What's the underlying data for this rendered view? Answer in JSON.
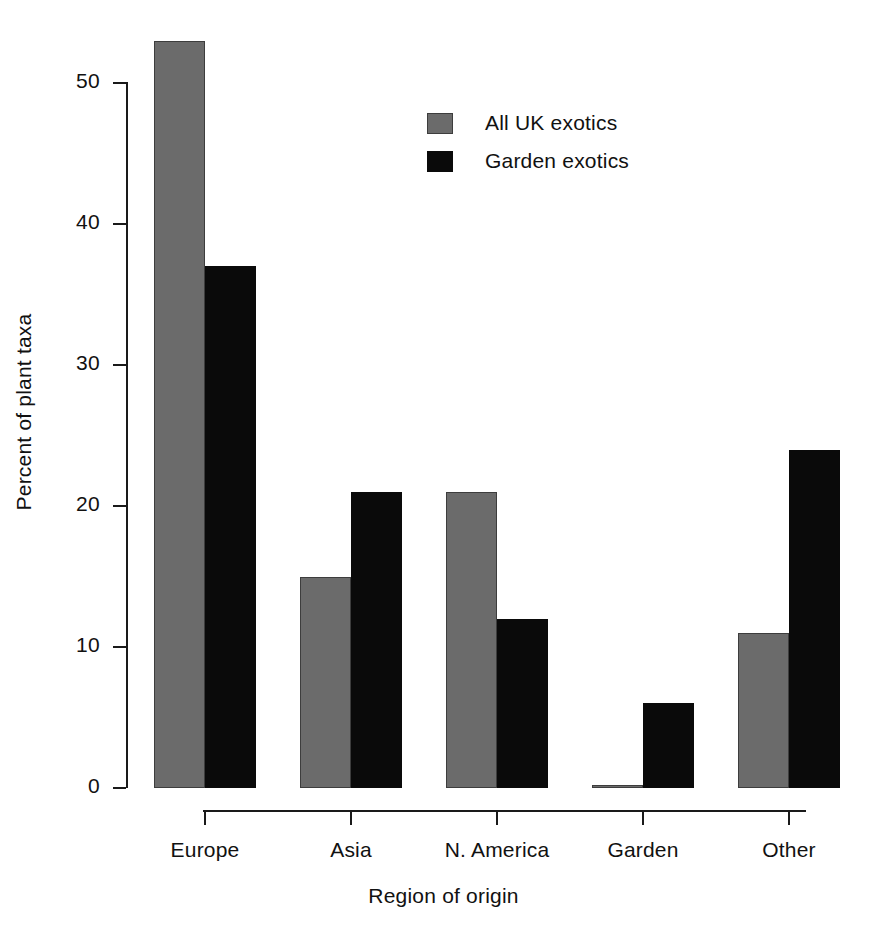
{
  "chart_data": {
    "type": "bar",
    "title": "",
    "xlabel": "Region of origin",
    "ylabel": "Percent of plant taxa",
    "categories": [
      "Europe",
      "Asia",
      "N. America",
      "Garden",
      "Other"
    ],
    "series": [
      {
        "name": "All UK exotics",
        "color": "#6b6b6b",
        "values": [
          53,
          15,
          21,
          0.2,
          11
        ]
      },
      {
        "name": "Garden exotics",
        "color": "#0a0a0a",
        "values": [
          37,
          21,
          12,
          6,
          24
        ]
      }
    ],
    "ylim": [
      0,
      53
    ],
    "yticks": [
      0,
      10,
      20,
      30,
      40,
      50
    ],
    "ytick_labels": [
      "0",
      "10",
      "20",
      "30",
      "40",
      "50"
    ],
    "grid": false,
    "legend_position": "top-center",
    "legend": [
      "All UK exotics",
      "Garden exotics"
    ]
  },
  "axes": {
    "y_title": "Percent of plant taxa",
    "x_title": "Region of origin"
  }
}
